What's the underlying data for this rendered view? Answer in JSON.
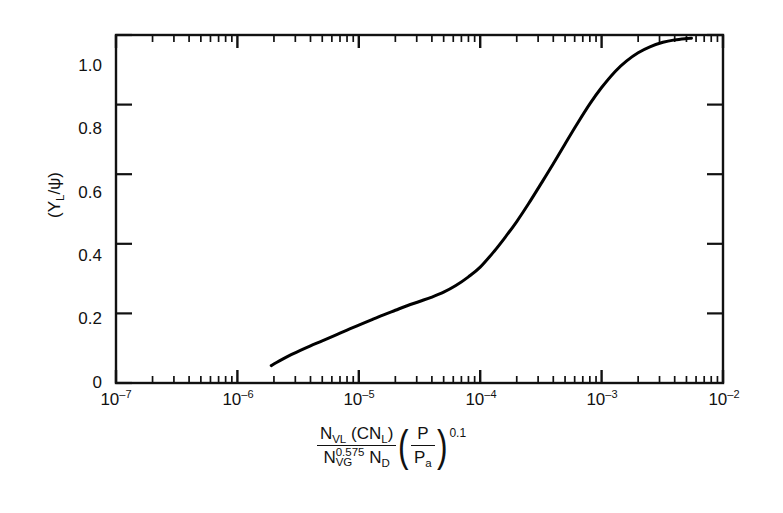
{
  "chart_data": {
    "type": "line",
    "title": "",
    "subtitle": "",
    "xlabel_text": "N_VL (CN_L) / (N_VG^0.575 N_D) x (P/P_a)^0.1",
    "ylabel_text": "(Y_L/ψ)",
    "xscale": "log",
    "yscale": "linear",
    "xlim": [
      1e-07,
      0.01
    ],
    "ylim": [
      0,
      1.0
    ],
    "grid": false,
    "legend": "none",
    "x_ticklabels": [
      {
        "mantissa": "10",
        "exponent": "–7",
        "value": 1e-07
      },
      {
        "mantissa": "10",
        "exponent": "–6",
        "value": 1e-06
      },
      {
        "mantissa": "10",
        "exponent": "–5",
        "value": 1e-05
      },
      {
        "mantissa": "10",
        "exponent": "–4",
        "value": 0.0001
      },
      {
        "mantissa": "10",
        "exponent": "–3",
        "value": 0.001
      },
      {
        "mantissa": "10",
        "exponent": "–2",
        "value": 0.01
      }
    ],
    "y_ticklabels": [
      "0",
      "0.2",
      "0.4",
      "0.6",
      "0.8",
      "1.0"
    ],
    "y_tickvalues": [
      0,
      0.2,
      0.4,
      0.6,
      0.8,
      1.0
    ],
    "series": [
      {
        "name": "Y_L/psi correlation",
        "color": "#000000",
        "linewidth": 3,
        "points": [
          [
            1.9e-06,
            0.05
          ],
          [
            2.1e-06,
            0.059
          ],
          [
            2.4e-06,
            0.07
          ],
          [
            2.8e-06,
            0.082
          ],
          [
            3.3e-06,
            0.094
          ],
          [
            4e-06,
            0.107
          ],
          [
            5e-06,
            0.121
          ],
          [
            6.3e-06,
            0.136
          ],
          [
            8e-06,
            0.152
          ],
          [
            1e-05,
            0.166
          ],
          [
            1.3e-05,
            0.183
          ],
          [
            1.6e-05,
            0.196
          ],
          [
            2e-05,
            0.209
          ],
          [
            2.5e-05,
            0.222
          ],
          [
            3.2e-05,
            0.235
          ],
          [
            4e-05,
            0.247
          ],
          [
            5e-05,
            0.261
          ],
          [
            6.3e-05,
            0.28
          ],
          [
            8e-05,
            0.305
          ],
          [
            0.0001,
            0.333
          ],
          [
            0.00013,
            0.378
          ],
          [
            0.00016,
            0.418
          ],
          [
            0.0002,
            0.464
          ],
          [
            0.00025,
            0.515
          ],
          [
            0.00032,
            0.575
          ],
          [
            0.0004,
            0.63
          ],
          [
            0.0005,
            0.687
          ],
          [
            0.00063,
            0.745
          ],
          [
            0.0008,
            0.802
          ],
          [
            0.001,
            0.849
          ],
          [
            0.0013,
            0.896
          ],
          [
            0.0016,
            0.925
          ],
          [
            0.002,
            0.949
          ],
          [
            0.0025,
            0.966
          ],
          [
            0.0032,
            0.979
          ],
          [
            0.004,
            0.986
          ],
          [
            0.005,
            0.99
          ],
          [
            0.0055,
            0.991
          ]
        ]
      }
    ],
    "curve_start": {
      "x": 1.9e-06,
      "y": 0.05
    },
    "curve_end": {
      "x": 0.0055,
      "y": 0.99
    }
  },
  "axes": {
    "ylabel": {
      "open_paren": "(",
      "y_main": "Y",
      "y_sub": "L",
      "slash": "/",
      "psi": "ψ",
      "close_paren": ")"
    },
    "xlabel": {
      "numerator_n": "N",
      "numerator_n_sub": "VL",
      "numerator_paren_open": "(CN",
      "numerator_paren_sub": "L",
      "numerator_paren_close": ")",
      "denominator_n": "N",
      "denominator_n_sub": "VG",
      "denominator_n_exp": "0.575",
      "denominator_nd": "N",
      "denominator_nd_sub": "D",
      "paren_open": "(",
      "ratio_num": "P",
      "ratio_den_p": "P",
      "ratio_den_sub": "a",
      "paren_close": ")",
      "outer_exponent": "0.1"
    }
  },
  "colors": {
    "axis": "#111111",
    "curve": "#000000",
    "background": "#ffffff"
  }
}
